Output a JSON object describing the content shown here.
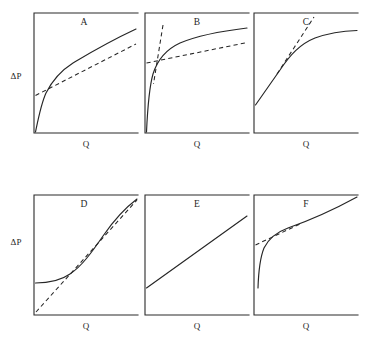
{
  "figure": {
    "y_axis_label": "ΔP",
    "x_axis_label": "Q",
    "panels": [
      {
        "letter": "A",
        "letter_x": 84,
        "letter_y": 25,
        "frame": {
          "x": 34,
          "y": 13,
          "w": 104,
          "h": 120
        },
        "xlabel_x": 86,
        "xlabel_y": 147,
        "curve": "M 35.5 132 C 38 120, 41 104, 46 93 C 53 79, 62 70, 73 63 C 88 54, 106 43, 136 29",
        "dashes": [
          "M 35.5 95.5 L 136 44"
        ]
      },
      {
        "letter": "B",
        "letter_x": 197,
        "letter_y": 25,
        "frame": {
          "x": 145,
          "y": 13,
          "w": 104,
          "h": 120
        },
        "xlabel_x": 197,
        "xlabel_y": 147,
        "curve": "M 146.5 132 C 147.5 110, 149 88, 153 74 C 158 58, 167 49, 180 43 C 199 35, 222 31, 247 28",
        "dashes": [
          "M 146.5 63 L 247 42.5",
          "M 163 25 L 153.5 84"
        ]
      },
      {
        "letter": "C",
        "letter_x": 306,
        "letter_y": 25,
        "frame": {
          "x": 254,
          "y": 13,
          "w": 104,
          "h": 120
        },
        "xlabel_x": 306,
        "xlabel_y": 147,
        "curve": "M 255.5 105 L 280 70 C 290 55, 300 44, 315 38 C 329 33, 344 31, 357 30.5",
        "dashes": [
          "M 277 74 L 314 17"
        ]
      },
      {
        "letter": "D",
        "letter_x": 84,
        "letter_y": 207,
        "frame": {
          "x": 34,
          "y": 195,
          "w": 104,
          "h": 120
        },
        "xlabel_x": 86,
        "xlabel_y": 329,
        "curve": "M 35.5 283 C 48 283, 60 281, 70 274 C 82 266, 92 252, 103 236 C 114 220, 125 208, 137 199",
        "dashes": [
          "M 36 312 L 137 200"
        ]
      },
      {
        "letter": "E",
        "letter_x": 197,
        "letter_y": 207,
        "frame": {
          "x": 145,
          "y": 195,
          "w": 104,
          "h": 120
        },
        "xlabel_x": 197,
        "xlabel_y": 329,
        "curve": "M 146.5 288 L 247 216",
        "dashes": []
      },
      {
        "letter": "F",
        "letter_x": 306,
        "letter_y": 207,
        "frame": {
          "x": 254,
          "y": 195,
          "w": 104,
          "h": 120
        },
        "xlabel_x": 306,
        "xlabel_y": 329,
        "curve": "M 258 288 C 258.5 272, 260 258, 264 248 C 269 238, 277 232, 288 228 C 308 221, 335 209, 357 197",
        "dashes": [
          "M 255.5 245 L 300 224"
        ]
      }
    ],
    "y_labels": [
      {
        "text_key": "y_axis_label",
        "x": 16,
        "y": 79
      },
      {
        "text_key": "y_axis_label",
        "x": 16,
        "y": 245
      }
    ]
  },
  "chart_data": {
    "type": "line",
    "title": "",
    "xlabel": "Q",
    "ylabel": "ΔP",
    "grid": false,
    "legend": "none",
    "panel_count": 6,
    "panel_layout": "2 rows x 3 columns",
    "panels": [
      {
        "label": "A",
        "curve_type": "concave-down power law through origin",
        "intercept": 0,
        "passes_through_origin": true,
        "plateau": false,
        "dashed_lines": 1,
        "dashed_description": "single straight tangent/asymptote with positive ΔP intercept, touching the curve at mid range",
        "x": [
          0,
          0.08,
          0.18,
          0.3,
          0.45,
          0.6,
          0.78,
          1.0
        ],
        "y": [
          0,
          0.24,
          0.4,
          0.52,
          0.63,
          0.72,
          0.8,
          0.87
        ],
        "dashed_series": [
          {
            "name": "asymptote",
            "x": [
              0,
              1.0
            ],
            "y": [
              0.31,
              0.74
            ]
          }
        ]
      },
      {
        "label": "B",
        "curve_type": "strongly concave-down, rapid saturation from origin",
        "intercept": 0,
        "passes_through_origin": true,
        "plateau": true,
        "dashed_lines": 2,
        "dashed_description": "two dashed straight lines forming an X crossing near the low-Q knee: one steep initial-slope line and one shallow high-Q asymptote",
        "x": [
          0,
          0.03,
          0.07,
          0.14,
          0.25,
          0.4,
          0.6,
          0.8,
          1.0
        ],
        "y": [
          0,
          0.3,
          0.47,
          0.62,
          0.73,
          0.8,
          0.85,
          0.87,
          0.89
        ],
        "dashed_series": [
          {
            "name": "high-Q asymptote",
            "x": [
              0,
              1.0
            ],
            "y": [
              0.58,
              0.76
            ]
          },
          {
            "name": "initial-slope line",
            "x": [
              0.06,
              0.17
            ],
            "y": [
              0.9,
              0.4
            ]
          }
        ]
      },
      {
        "label": "C",
        "curve_type": "linear at low Q bending to a horizontal plateau",
        "intercept": 0.23,
        "passes_through_origin": false,
        "plateau": true,
        "dashed_lines": 1,
        "dashed_description": "dashed straight extension of the initial linear portion continuing upward past the bend",
        "x": [
          0,
          0.25,
          0.4,
          0.55,
          0.72,
          0.85,
          1.0
        ],
        "y": [
          0.23,
          0.52,
          0.65,
          0.76,
          0.82,
          0.85,
          0.855
        ],
        "dashed_series": [
          {
            "name": "initial-slope extension",
            "x": [
              0.22,
              0.58
            ],
            "y": [
              0.48,
              0.95
            ]
          }
        ]
      },
      {
        "label": "D",
        "curve_type": "concave-up (convex), flat at low Q then rising",
        "intercept": 0.27,
        "passes_through_origin": false,
        "plateau": false,
        "dashed_lines": 1,
        "dashed_description": "dashed straight asymptote rising from near the origin and merging with the curve at high Q",
        "x": [
          0,
          0.15,
          0.3,
          0.45,
          0.62,
          0.8,
          1.0
        ],
        "y": [
          0.27,
          0.28,
          0.33,
          0.43,
          0.57,
          0.72,
          0.87
        ],
        "dashed_series": [
          {
            "name": "high-Q asymptote",
            "x": [
              0.02,
              1.0
            ],
            "y": [
              0.03,
              0.86
            ]
          }
        ]
      },
      {
        "label": "E",
        "curve_type": "straight line with positive intercept (Bingham plastic)",
        "intercept": 0.23,
        "passes_through_origin": false,
        "plateau": false,
        "dashed_lines": 0,
        "dashed_description": "none",
        "x": [
          0,
          0.25,
          0.5,
          0.75,
          1.0
        ],
        "y": [
          0.23,
          0.38,
          0.53,
          0.68,
          0.83
        ],
        "dashed_series": []
      },
      {
        "label": "F",
        "curve_type": "steep rise at very low Q then straight line of gentle slope",
        "intercept": 0,
        "passes_through_origin": true,
        "plateau": false,
        "dashed_lines": 1,
        "dashed_description": "short dashed straight segment extending the high-Q line back to the ΔP axis intercept",
        "x": [
          0.04,
          0.06,
          0.1,
          0.18,
          0.33,
          0.55,
          0.8,
          1.0
        ],
        "y": [
          0.23,
          0.37,
          0.48,
          0.57,
          0.64,
          0.72,
          0.8,
          0.86
        ],
        "dashed_series": [
          {
            "name": "line back-extrapolation",
            "x": [
              0,
              0.44
            ],
            "y": [
              0.52,
              0.69
            ]
          }
        ]
      }
    ]
  }
}
